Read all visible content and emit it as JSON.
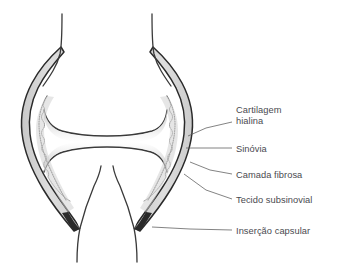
{
  "figure": {
    "background_color": "#ffffff",
    "width": 342,
    "height": 264
  },
  "colors": {
    "outline": "#2a2a2a",
    "bone_outline": "#3a3a3a",
    "capsule_fill": "#d9d9d9",
    "subsynovial_fill": "#cfcfcf",
    "cartilage_fill": "#e8e8e8",
    "synovial_line": "#6b6b6b",
    "leader_line": "#5a5a5a",
    "label_text": "#4a4a4f",
    "interior_fill": "#ffffff"
  },
  "labels": [
    {
      "id": "cartilagem-hialina",
      "line1": "Cartilagem",
      "line2": "hialina",
      "points_to": "hyaline-cartilage"
    },
    {
      "id": "sinovia",
      "line1": "Sinóvia",
      "line2": "",
      "points_to": "synovial-membrane"
    },
    {
      "id": "camada-fibrosa",
      "line1": "Camada fibrosa",
      "line2": "",
      "points_to": "fibrous-layer"
    },
    {
      "id": "tecido-subsinovial",
      "line1": "Tecido subsinovial",
      "line2": "",
      "points_to": "subsynovial-tissue"
    },
    {
      "id": "insercao-capsular",
      "line1": "Inserção capsular",
      "line2": "",
      "points_to": "capsular-insertion"
    }
  ],
  "anatomy": {
    "upper_bone": "Osso superior (epífise distal)",
    "lower_bone": "Osso inferior (epífise proximal)",
    "joint_cavity": "Cavidade articular",
    "capsule": "Cápsula articular"
  }
}
